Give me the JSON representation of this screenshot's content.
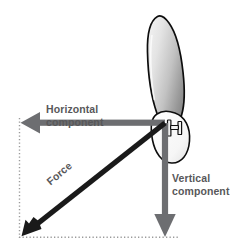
{
  "figure": {
    "type": "vector-force-diagram",
    "background_color": "#ffffff"
  },
  "colors": {
    "component_arrow": "#6d6e71",
    "force_arrow": "#1a1a1a",
    "label_text": "#58585a",
    "guide_line": "#9a9a9a",
    "blade_outline": "#000000",
    "blade_fill_light": "#ececec",
    "blade_fill_dark": "#8e8e8e",
    "hub_fill": "#ffffff"
  },
  "labels": {
    "horizontal": {
      "line1": "Horizontal",
      "line2": "component"
    },
    "vertical": {
      "line1": "Vertical",
      "line2": "component"
    },
    "force": {
      "line1": "Force"
    }
  },
  "vectors": [
    {
      "name": "horizontal-component",
      "label": "Horizontal component",
      "origin": [
        165,
        123
      ],
      "tip": [
        21,
        123
      ],
      "direction": "left",
      "color": "#6d6e71"
    },
    {
      "name": "vertical-component",
      "label": "Vertical component",
      "origin": [
        165,
        123
      ],
      "tip": [
        165,
        237
      ],
      "direction": "down",
      "color": "#6d6e71"
    },
    {
      "name": "resultant-force",
      "label": "Force",
      "origin": [
        165,
        123
      ],
      "tip": [
        24,
        234
      ],
      "direction": "down-left",
      "color": "#1a1a1a"
    }
  ],
  "guides": [
    {
      "name": "left-guide",
      "from": [
        19,
        118
      ],
      "to": [
        19,
        238
      ],
      "style": "dotted"
    },
    {
      "name": "bottom-guide",
      "from": [
        19,
        237
      ],
      "to": [
        178,
        237
      ],
      "style": "dotted"
    }
  ],
  "blade": {
    "name": "propeller-blade",
    "description": "elongated tapered blade inclined to the right",
    "tip": [
      158,
      16
    ],
    "root": [
      176,
      118
    ]
  },
  "hub": {
    "name": "blade-hub",
    "description": "rounded hub with bolt fitting",
    "center": [
      176,
      130
    ]
  }
}
